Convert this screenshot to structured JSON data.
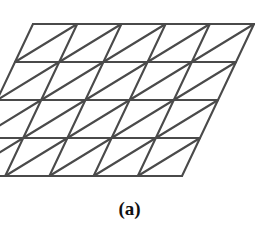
{
  "figure": {
    "caption": "(a)",
    "background_color": "#ffffff",
    "line_color": "#4a4a4a",
    "line_width": 2.1,
    "geometry": {
      "type": "triangular-lattice",
      "rows": 4,
      "columns": 5,
      "cell_width": 44.2,
      "row_height": 38.0,
      "row_shift_x": 18.0,
      "origin_x": 33.0,
      "origin_y": 24.0,
      "shape": "parallelogram",
      "triangles_total": 40,
      "vertices_per_row": 6
    },
    "row_lines": [
      {
        "name": "row-line-1",
        "y": 24.0,
        "x1": 33.0,
        "x2": 210.0
      },
      {
        "name": "row-line-2",
        "y": 62.0,
        "x1": 15.0,
        "x2": 225.0
      },
      {
        "name": "row-line-3",
        "y": 100.0,
        "x1": 28.0,
        "x2": 243.0
      },
      {
        "name": "row-line-4",
        "y": 138.0,
        "x1": 13.0,
        "x2": 222.0
      },
      {
        "name": "row-line-5",
        "y": 175.0,
        "x1": 31.0,
        "x2": 245.0
      }
    ]
  }
}
